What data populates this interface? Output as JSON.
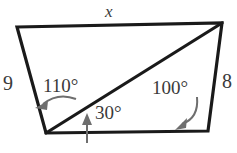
{
  "figure": {
    "stroke_color": "#1a1a1a",
    "text_color": "#3a3a3a",
    "arrow_color": "#6e6e6e",
    "background": "#ffffff",
    "vertices": {
      "top_left": [
        17,
        27
      ],
      "top_right": [
        222,
        23
      ],
      "bottom_right": [
        208,
        131
      ],
      "bottom_left": [
        46,
        133
      ]
    },
    "diagonal": {
      "from": [
        46,
        133
      ],
      "to": [
        222,
        23
      ]
    }
  },
  "labels": {
    "top_side": "x",
    "left_side": "9",
    "right_side": "8",
    "angle_upper_left": "110°",
    "angle_lower_left": "30°",
    "angle_lower_right": "100°"
  }
}
